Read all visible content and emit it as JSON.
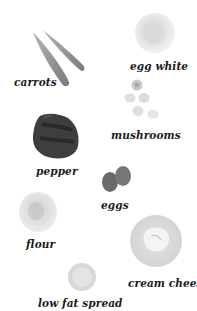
{
  "ingredients": [
    {
      "id": "carrots",
      "label": "carrots"
    },
    {
      "id": "egg-white",
      "label": "egg white"
    },
    {
      "id": "mushrooms",
      "label": "mushrooms"
    },
    {
      "id": "pepper",
      "label": "pepper"
    },
    {
      "id": "eggs",
      "label": "eggs"
    },
    {
      "id": "flour",
      "label": "flour"
    },
    {
      "id": "cream-cheese",
      "label": "cream cheese"
    },
    {
      "id": "low-fat-spread",
      "label": "low fat spread"
    }
  ],
  "colors": {
    "background": "#ffffff",
    "label_text": "#1a1a1a",
    "carrot": "#8a8a8a",
    "pepper": "#3a3a3a",
    "egg_shell": "#6f6f6f",
    "bowl_light": "#e6e6e6"
  }
}
